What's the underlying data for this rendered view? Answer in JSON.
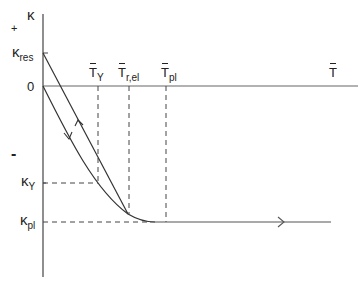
{
  "axes": {
    "y_symbol": "κ",
    "x_symbol": "T",
    "positive_sign": "+",
    "negative_sign": "-",
    "origin": "0"
  },
  "y_labels": {
    "kappa_res": {
      "main": "κ",
      "sub": "res"
    },
    "kappa_Y": {
      "main": "κ",
      "sub": "Y"
    },
    "kappa_pl": {
      "main": "κ",
      "sub": "pl"
    }
  },
  "x_labels": {
    "T_Y": {
      "main": "T",
      "sub": "Y"
    },
    "T_rel": {
      "main": "T",
      "sub": "r,el"
    },
    "T_pl": {
      "main": "T",
      "sub": "pl"
    },
    "T": {
      "main": "T",
      "sub": ""
    }
  },
  "colors": {
    "line": "#333333",
    "axis": "#444444",
    "dash": "#444444"
  }
}
